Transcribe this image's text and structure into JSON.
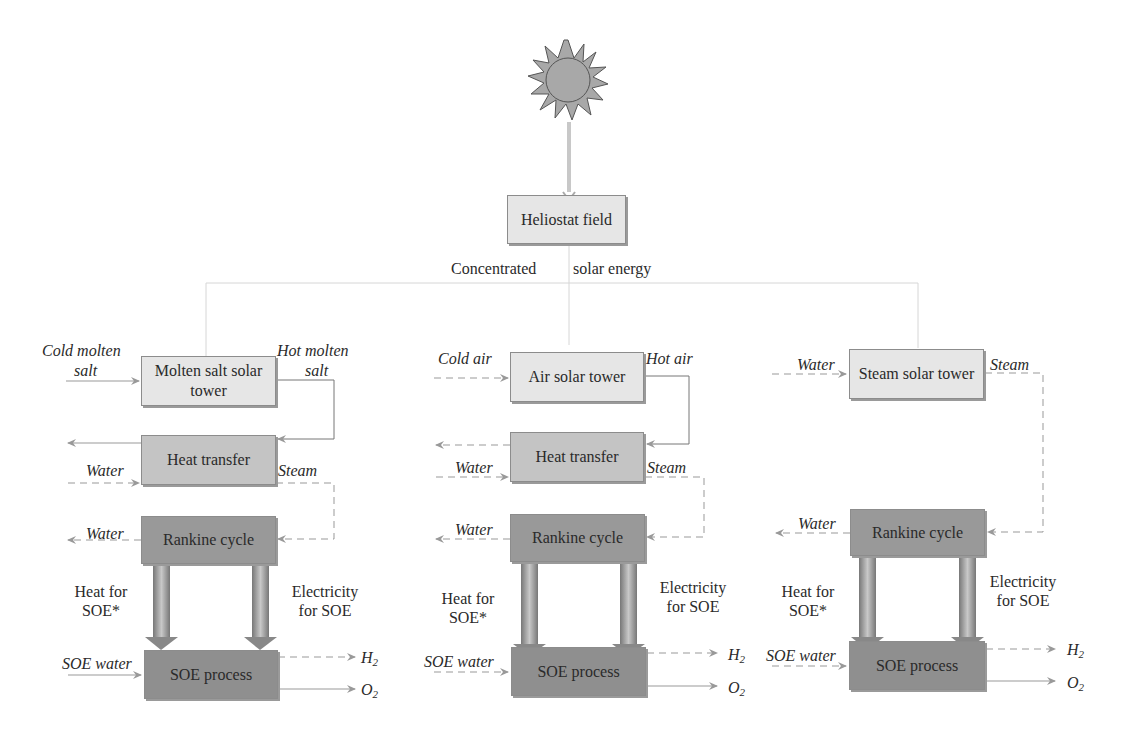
{
  "diagram": {
    "source": {
      "label": "sun",
      "icon": "sun-icon"
    },
    "heliostat": {
      "label": "Heliostat field"
    },
    "energy_label_left": "Concentrated",
    "energy_label_right": "solar energy",
    "columns": [
      {
        "tower": {
          "label": "Molten salt solar tower"
        },
        "tower_in": "Cold molten salt",
        "tower_in_l1": "Cold molten",
        "tower_in_l2": "salt",
        "tower_out_l1": "Hot molten",
        "tower_out_l2": "salt",
        "heat_transfer": {
          "label": "Heat transfer"
        },
        "ht_water_in": "Water",
        "ht_steam_out": "Steam",
        "rankine": {
          "label": "Rankine cycle"
        },
        "rankine_water_out": "Water",
        "heat_label_l1": "Heat for",
        "heat_label_l2": "SOE*",
        "elec_label_l1": "Electricity",
        "elec_label_l2": "for SOE",
        "soe": {
          "label": "SOE process"
        },
        "soe_water_in": "SOE water",
        "out_h2": "H",
        "out_o2": "O",
        "sub": "2"
      },
      {
        "tower": {
          "label": "Air solar tower"
        },
        "tower_in": "Cold air",
        "tower_out": "Hot air",
        "heat_transfer": {
          "label": "Heat transfer"
        },
        "ht_water_in": "Water",
        "ht_steam_out": "Steam",
        "rankine": {
          "label": "Rankine cycle"
        },
        "rankine_water_out": "Water",
        "heat_label_l1": "Heat for",
        "heat_label_l2": "SOE*",
        "elec_label_l1": "Electricity",
        "elec_label_l2": "for SOE",
        "soe": {
          "label": "SOE process"
        },
        "soe_water_in": "SOE water",
        "out_h2": "H",
        "out_o2": "O",
        "sub": "2"
      },
      {
        "tower": {
          "label": "Steam solar tower"
        },
        "tower_in": "Water",
        "tower_out": "Steam",
        "rankine": {
          "label": "Rankine cycle"
        },
        "rankine_water_out": "Water",
        "heat_label_l1": "Heat for",
        "heat_label_l2": "SOE*",
        "elec_label_l1": "Electricity",
        "elec_label_l2": "for SOE",
        "soe": {
          "label": "SOE process"
        },
        "soe_water_in": "SOE water",
        "out_h2": "H",
        "out_o2": "O",
        "sub": "2"
      }
    ]
  },
  "colors": {
    "light_box": "#e6e6e6",
    "mid_box": "#c4c4c4",
    "dark_box": "#999999",
    "line": "#9a9a9a",
    "sun": "#a8a8a8"
  }
}
